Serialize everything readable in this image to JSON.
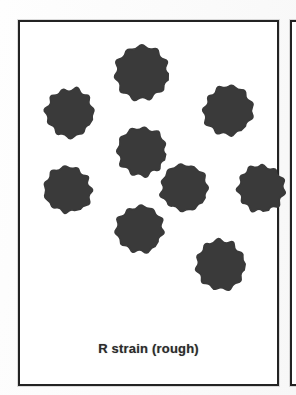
{
  "figure": {
    "domain_label": "biology-textbook-figure",
    "background_color": "#ffffff",
    "panel_border_color": "#232323"
  },
  "panel_main": {
    "name": "r-strain-panel",
    "caption": "R strain (rough)",
    "caption_color": "#2b2b2b",
    "cell_fill_color": "#3a3a3a",
    "cell_count": 9,
    "cell_morphology": "rough",
    "cells": [
      {
        "id": "cell-1",
        "cx": 124,
        "cy": 53,
        "r": 30,
        "lobes": 11,
        "rotation": 8,
        "roughness": 0.22
      },
      {
        "id": "cell-2",
        "cx": 52,
        "cy": 93,
        "r": 27,
        "lobes": 11,
        "rotation": 24,
        "roughness": 0.23
      },
      {
        "id": "cell-3",
        "cx": 210,
        "cy": 90,
        "r": 27,
        "lobes": 11,
        "rotation": 50,
        "roughness": 0.22
      },
      {
        "id": "cell-4",
        "cx": 124,
        "cy": 131,
        "r": 27,
        "lobes": 11,
        "rotation": 15,
        "roughness": 0.23
      },
      {
        "id": "cell-5",
        "cx": 50,
        "cy": 170,
        "r": 26,
        "lobes": 11,
        "rotation": 65,
        "roughness": 0.23
      },
      {
        "id": "cell-6",
        "cx": 166,
        "cy": 168,
        "r": 26,
        "lobes": 11,
        "rotation": 32,
        "roughness": 0.22
      },
      {
        "id": "cell-7",
        "cx": 243,
        "cy": 168,
        "r": 26,
        "lobes": 11,
        "rotation": 78,
        "roughness": 0.23
      },
      {
        "id": "cell-8",
        "cx": 122,
        "cy": 209,
        "r": 26,
        "lobes": 11,
        "rotation": 42,
        "roughness": 0.22
      },
      {
        "id": "cell-9",
        "cx": 202,
        "cy": 245,
        "r": 28,
        "lobes": 11,
        "rotation": 5,
        "roughness": 0.24
      }
    ]
  },
  "panel_next": {
    "name": "adjacent-panel-edge",
    "visible_fragment": true
  }
}
